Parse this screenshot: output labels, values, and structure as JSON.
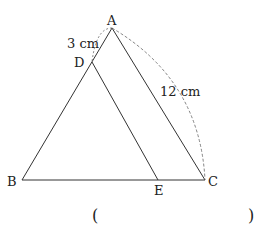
{
  "diagram": {
    "points": {
      "A": {
        "label": "A",
        "x": 112,
        "y": 28
      },
      "B": {
        "label": "B",
        "x": 22,
        "y": 180
      },
      "C": {
        "label": "C",
        "x": 205,
        "y": 180
      },
      "D": {
        "label": "D",
        "x": 92,
        "y": 62
      },
      "E": {
        "label": "E",
        "x": 158,
        "y": 180
      }
    },
    "measurements": {
      "AD": "3 cm",
      "AC": "12 cm"
    },
    "answer_blank": {
      "open": "(",
      "close": ")"
    },
    "colors": {
      "line": "#333333",
      "dashed": "#666666"
    }
  }
}
